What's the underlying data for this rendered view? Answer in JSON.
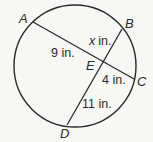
{
  "diagram": {
    "type": "circle-intersecting-chords",
    "circle": {
      "cx": 75,
      "cy": 66,
      "r": 61
    },
    "points": {
      "A": {
        "label": "A",
        "x": 33,
        "y": 22
      },
      "B": {
        "label": "B",
        "x": 122,
        "y": 29
      },
      "C": {
        "label": "C",
        "x": 134,
        "y": 79
      },
      "D": {
        "label": "D",
        "x": 67,
        "y": 125
      },
      "E": {
        "label": "E",
        "x": 102,
        "y": 61
      }
    },
    "chords": [
      {
        "from": "A",
        "to": "C"
      },
      {
        "from": "B",
        "to": "D"
      }
    ],
    "segments": {
      "AE": {
        "value": "9",
        "unit": "in.",
        "text": "9 in."
      },
      "EB": {
        "value": "x",
        "unit": "in.",
        "text": "in."
      },
      "EC": {
        "value": "4",
        "unit": "in.",
        "text": "4 in."
      },
      "ED": {
        "value": "11",
        "unit": "in.",
        "text": "11 in."
      }
    },
    "colors": {
      "stroke": "#2a2a2a",
      "background": "#f7f7f5"
    }
  }
}
